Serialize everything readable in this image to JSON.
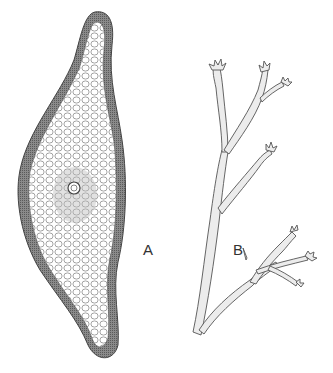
{
  "figure": {
    "panels": [
      {
        "id": "A",
        "label": "A",
        "description": "cross-section of a flattened thallus with a central pore, cellular interior and dense cortical rim"
      },
      {
        "id": "B",
        "label": "B",
        "description": "branching thallus with toothed/serrated branch tips"
      }
    ]
  },
  "colors": {
    "background": "#ffffff",
    "ink": "#555555",
    "rim": "#7a7a7a",
    "fill": "#ececec"
  }
}
